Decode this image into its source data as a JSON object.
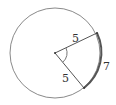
{
  "diagram": {
    "radius_label_upper": "5",
    "radius_label_lower": "5",
    "arc_label": "7",
    "radius_length": 5,
    "arc_length": 7,
    "colors": {
      "stroke": "#666666",
      "text": "#333333"
    }
  }
}
